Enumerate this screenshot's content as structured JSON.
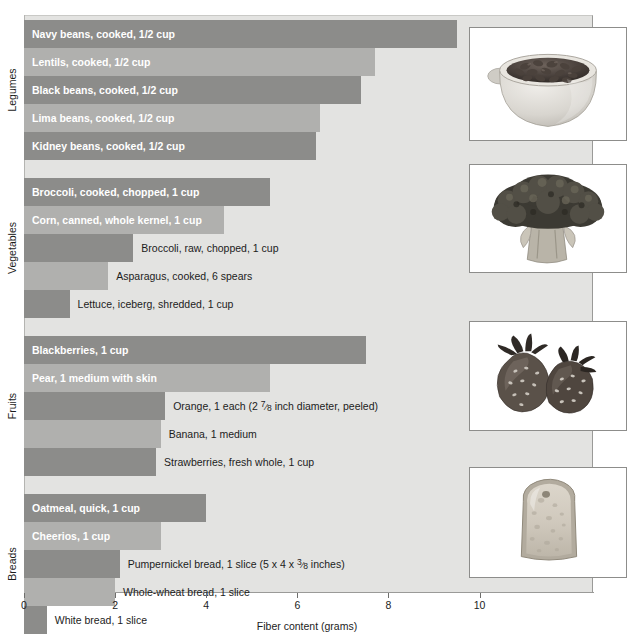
{
  "chart_data": {
    "type": "bar",
    "orientation": "horizontal",
    "title": "",
    "xlabel": "Fiber content (grams)",
    "ylabel": "",
    "xlim": [
      0,
      12.5
    ],
    "xticks": [
      0,
      2,
      4,
      6,
      8,
      10
    ],
    "xtick_labels": [
      "0",
      "2",
      "4",
      "6",
      "8",
      "10"
    ],
    "grid": false,
    "legend": "none",
    "groups": [
      {
        "name": "Legumes",
        "items": [
          {
            "label": "Navy beans, cooked, 1/2 cup",
            "value": 9.5,
            "shade": "dark",
            "label_inside": true
          },
          {
            "label": "Lentils, cooked, 1/2 cup",
            "value": 7.7,
            "shade": "light",
            "label_inside": true
          },
          {
            "label": "Black beans, cooked, 1/2 cup",
            "value": 7.4,
            "shade": "dark",
            "label_inside": true
          },
          {
            "label": "Lima beans, cooked, 1/2 cup",
            "value": 6.5,
            "shade": "light",
            "label_inside": true
          },
          {
            "label": "Kidney beans, cooked, 1/2 cup",
            "value": 6.4,
            "shade": "dark",
            "label_inside": true
          }
        ]
      },
      {
        "name": "Vegetables",
        "items": [
          {
            "label": "Broccoli, cooked, chopped, 1 cup",
            "value": 5.4,
            "shade": "dark",
            "label_inside": true
          },
          {
            "label": "Corn, canned, whole kernel, 1 cup",
            "value": 4.4,
            "shade": "light",
            "label_inside": true
          },
          {
            "label": "Broccoli, raw, chopped, 1 cup",
            "value": 2.4,
            "shade": "dark",
            "label_inside": false
          },
          {
            "label": "Asparagus, cooked, 6 spears",
            "value": 1.85,
            "shade": "light",
            "label_inside": false
          },
          {
            "label": "Lettuce, iceberg, shredded, 1 cup",
            "value": 1.0,
            "shade": "dark",
            "label_inside": false
          }
        ]
      },
      {
        "name": "Fruits",
        "items": [
          {
            "label": "Blackberries, 1 cup",
            "value": 7.5,
            "shade": "dark",
            "label_inside": true
          },
          {
            "label": "Pear, 1 medium with skin",
            "value": 5.4,
            "shade": "light",
            "label_inside": true
          },
          {
            "label": "Orange, 1 each (2 7/8 inch diameter, peeled)",
            "value": 3.1,
            "shade": "dark",
            "label_inside": false,
            "fraction": {
              "pre": "Orange, 1 each (2 ",
              "num": "7",
              "den": "8",
              "post": " inch diameter, peeled)"
            }
          },
          {
            "label": "Banana, 1 medium",
            "value": 3.0,
            "shade": "light",
            "label_inside": false
          },
          {
            "label": "Strawberries, fresh whole, 1 cup",
            "value": 2.9,
            "shade": "dark",
            "label_inside": false
          }
        ]
      },
      {
        "name": "Breads",
        "items": [
          {
            "label": "Oatmeal, quick, 1 cup",
            "value": 4.0,
            "shade": "dark",
            "label_inside": true
          },
          {
            "label": "Cheerios, 1 cup",
            "value": 3.0,
            "shade": "light",
            "label_inside": true
          },
          {
            "label": "Pumpernickel bread, 1 slice (5 x 4 x 3/8 inches)",
            "value": 2.1,
            "shade": "dark",
            "label_inside": false,
            "fraction": {
              "pre": "Pumpernickel bread, 1 slice (5 x 4 x ",
              "num": "3",
              "den": "8",
              "post": " inches)"
            }
          },
          {
            "label": "Whole-wheat bread, 1 slice",
            "value": 2.0,
            "shade": "light",
            "label_inside": false
          },
          {
            "label": "White bread, 1 slice",
            "value": 0.5,
            "shade": "dark",
            "label_inside": false
          }
        ]
      }
    ]
  },
  "photos": [
    {
      "name": "black-beans-in-bowl-photo",
      "alt": "Bowl of black beans"
    },
    {
      "name": "broccoli-photo",
      "alt": "Head of broccoli"
    },
    {
      "name": "strawberries-photo",
      "alt": "Two strawberries"
    },
    {
      "name": "bread-slice-photo",
      "alt": "Slice of bread"
    }
  ],
  "colors": {
    "bar_dark": "#8c8c8a",
    "bar_light": "#b0b0ae",
    "plot_background": "#e3e3e1",
    "text": "#1c1c1c",
    "inside_label_text": "#ffffff"
  }
}
